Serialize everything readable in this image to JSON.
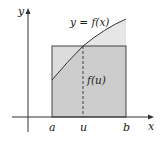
{
  "diagram": {
    "type": "mean-value-theorem-for-integrals",
    "axes": {
      "x_label": "x",
      "y_label": "y"
    },
    "curve_label": "y = f(x)",
    "rect_label": "f(u)",
    "ticks": [
      {
        "id": "a",
        "label": "a"
      },
      {
        "id": "u",
        "label": "u"
      },
      {
        "id": "b",
        "label": "b"
      }
    ],
    "colors": {
      "rect_fill": "#cdcdcd",
      "region_above_rect": "#e6e6e6",
      "region_above_curve_in_rect": "#dcdcdc",
      "stroke": "#333333"
    }
  }
}
